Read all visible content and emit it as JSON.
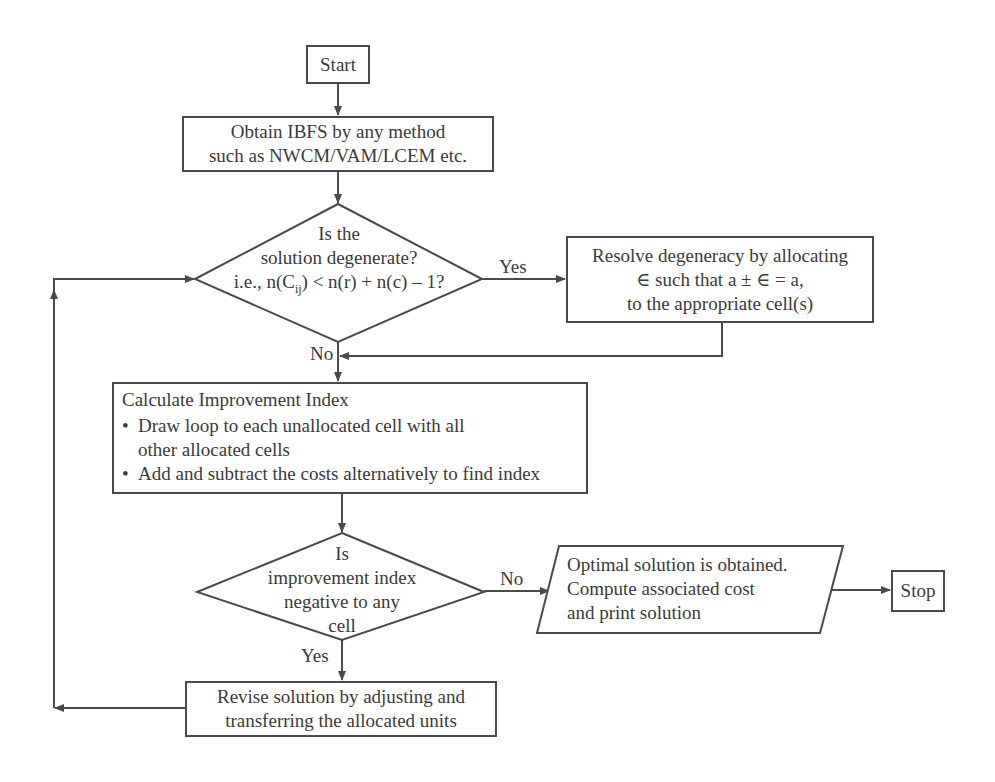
{
  "flowchart": {
    "start": "Start",
    "obtain_ibfs": {
      "line1": "Obtain IBFS by any method",
      "line2": "such as NWCM/VAM/LCEM etc."
    },
    "degenerate_decision": {
      "line1": "Is the",
      "line2": "solution degenerate?",
      "line3_prefix": "i.e., n(C",
      "line3_sub": "ij",
      "line3_suffix": ") < n(r) + n(c) – 1?"
    },
    "resolve_degeneracy": {
      "line1": "Resolve degeneracy by allocating",
      "line2": "∈ such that a ± ∈ = a,",
      "line3": "to the appropriate cell(s)"
    },
    "calculate_index": {
      "title": "Calculate Improvement Index",
      "bullets": [
        {
          "line1": "Draw loop to each unallocated cell with all",
          "line2": "other allocated cells"
        },
        {
          "line1": "Add and subtract the costs alternatively to find index"
        }
      ],
      "bullet_glyph": "•"
    },
    "improvement_decision": {
      "line1": "Is",
      "line2": "improvement index",
      "line3": "negative to any",
      "line4": "cell"
    },
    "optimal_output": {
      "line1": "Optimal solution is obtained.",
      "line2": "Compute associated cost",
      "line3": "and print solution"
    },
    "stop": "Stop",
    "revise_solution": {
      "line1": "Revise solution by adjusting and",
      "line2": "transferring the allocated units"
    },
    "edge_labels": {
      "degenerate_yes": "Yes",
      "degenerate_no": "No",
      "improvement_no": "No",
      "improvement_yes": "Yes"
    }
  },
  "colors": {
    "line": "#4a4a4a",
    "text": "#3a3a3a",
    "background": "#ffffff"
  }
}
